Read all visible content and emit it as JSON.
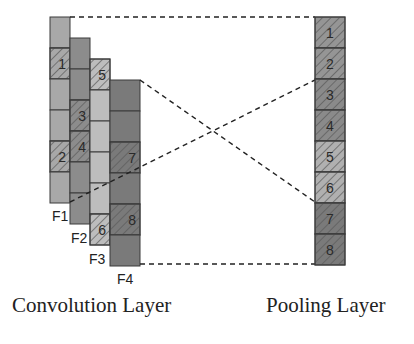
{
  "colors": {
    "f1_fill": "#a8a8a8",
    "f2_fill": "#8c8c8c",
    "f3_fill": "#bdbdbd",
    "f4_fill": "#7a7a7a",
    "pool_light": "#b0b0b0",
    "pool_mid": "#959595",
    "pool_dark": "#7a7a7a",
    "border": "#3a3a3a",
    "dash": "#222222"
  },
  "convolution": {
    "caption": "Convolution Layer",
    "feature_maps": [
      {
        "name": "F1",
        "label": "F1",
        "x": 50,
        "y": 17,
        "w": 20,
        "fill": "#a8a8a8",
        "cells": [
          {
            "hatched": false,
            "label": ""
          },
          {
            "hatched": true,
            "label": "1"
          },
          {
            "hatched": false,
            "label": ""
          },
          {
            "hatched": false,
            "label": ""
          },
          {
            "hatched": true,
            "label": "2"
          },
          {
            "hatched": false,
            "label": ""
          }
        ],
        "label_pos": {
          "x": 52,
          "y": 221
        }
      },
      {
        "name": "F2",
        "label": "F2",
        "x": 70,
        "y": 38,
        "w": 20,
        "fill": "#8c8c8c",
        "cells": [
          {
            "hatched": false,
            "label": ""
          },
          {
            "hatched": false,
            "label": ""
          },
          {
            "hatched": true,
            "label": "3"
          },
          {
            "hatched": true,
            "label": "4"
          },
          {
            "hatched": false,
            "label": ""
          },
          {
            "hatched": false,
            "label": ""
          }
        ],
        "label_pos": {
          "x": 71,
          "y": 243
        }
      },
      {
        "name": "F3",
        "label": "F3",
        "x": 90,
        "y": 59,
        "w": 20,
        "fill": "#bdbdbd",
        "cells": [
          {
            "hatched": true,
            "label": "5"
          },
          {
            "hatched": false,
            "label": ""
          },
          {
            "hatched": false,
            "label": ""
          },
          {
            "hatched": false,
            "label": ""
          },
          {
            "hatched": false,
            "label": ""
          },
          {
            "hatched": true,
            "label": "6"
          }
        ],
        "label_pos": {
          "x": 89,
          "y": 264
        }
      },
      {
        "name": "F4",
        "label": "F4",
        "x": 110,
        "y": 80,
        "w": 30,
        "fill": "#7a7a7a",
        "cells": [
          {
            "hatched": false,
            "label": ""
          },
          {
            "hatched": false,
            "label": ""
          },
          {
            "hatched": true,
            "label": "7"
          },
          {
            "hatched": false,
            "label": ""
          },
          {
            "hatched": true,
            "label": "8"
          },
          {
            "hatched": false,
            "label": ""
          }
        ],
        "label_pos": {
          "x": 117,
          "y": 284
        }
      }
    ],
    "cell_height": 31
  },
  "pooling": {
    "caption": "Pooling Layer",
    "x": 315,
    "y": 17,
    "w": 30,
    "cell_height": 31,
    "cells": [
      {
        "label": "1",
        "fill": "#959595"
      },
      {
        "label": "2",
        "fill": "#959595"
      },
      {
        "label": "3",
        "fill": "#8a8a8a"
      },
      {
        "label": "4",
        "fill": "#8a8a8a"
      },
      {
        "label": "5",
        "fill": "#b0b0b0"
      },
      {
        "label": "6",
        "fill": "#b0b0b0"
      },
      {
        "label": "7",
        "fill": "#7a7a7a"
      },
      {
        "label": "8",
        "fill": "#7a7a7a"
      }
    ]
  },
  "connectors": [
    {
      "name": "top-edge-link",
      "x1": 70,
      "y1": 17,
      "x2": 315,
      "y2": 17
    },
    {
      "name": "f4-top-to-pool-6",
      "x1": 140,
      "y1": 80,
      "x2": 315,
      "y2": 202
    },
    {
      "name": "f1-bottom-to-pool-3",
      "x1": 70,
      "y1": 202,
      "x2": 315,
      "y2": 80
    },
    {
      "name": "bottom-edge-link",
      "x1": 140,
      "y1": 264,
      "x2": 315,
      "y2": 264
    }
  ],
  "captions": {
    "convolution": "Convolution Layer",
    "pooling": "Pooling Layer"
  }
}
